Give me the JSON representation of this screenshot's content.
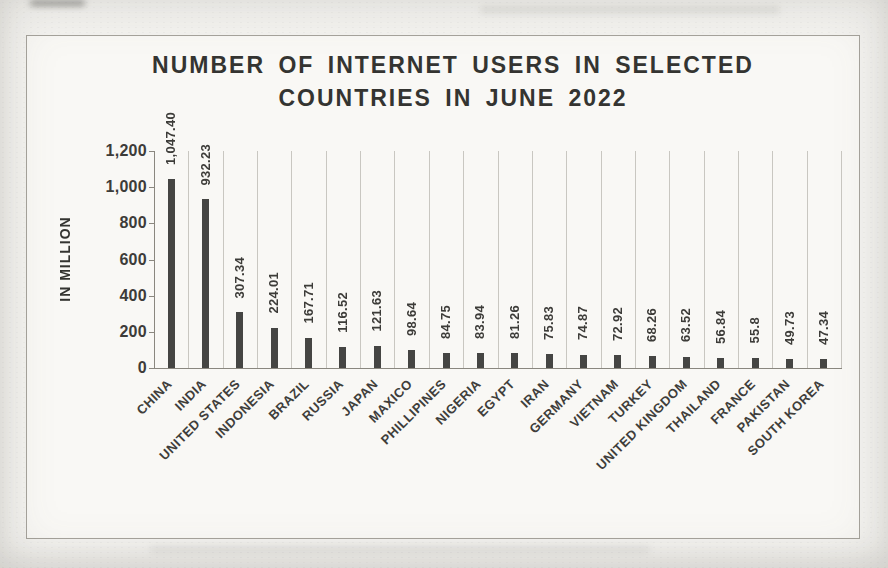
{
  "colors": {
    "bar": "#454543",
    "ink": "#343431",
    "gridline": "#c9c7c1",
    "axis": "#8a877f",
    "chart_border": "#a6a39c",
    "page_background": "#f4f3f0"
  },
  "chart_data": {
    "type": "bar",
    "title": "NUMBER OF INTERNET USERS IN SELECTED COUNTRIES IN JUNE 2022",
    "title_lines": [
      "NUMBER OF INTERNET USERS IN SELECTED",
      "COUNTRIES IN JUNE 2022"
    ],
    "xlabel": "",
    "ylabel": "IN MILLION",
    "ylim": [
      0,
      1200
    ],
    "ytick_step": 200,
    "ytick_labels": [
      "0",
      "200",
      "400",
      "600",
      "800",
      "1,000",
      "1,200"
    ],
    "grid": "vertical category gridlines only",
    "legend": "none",
    "data_labels": "rotated 90 degrees above each bar",
    "category_label_rotation_deg": 45,
    "categories": [
      "CHINA",
      "INDIA",
      "UNITED STATES",
      "INDONESIA",
      "BRAZIL",
      "RUSSIA",
      "JAPAN",
      "MAXICO",
      "PHILLIPINES",
      "NIGERIA",
      "EGYPT",
      "IRAN",
      "GERMANY",
      "VIETNAM",
      "TURKEY",
      "UNITED KINGDOM",
      "THAILAND",
      "FRANCE",
      "PAKISTAN",
      "SOUTH KOREA"
    ],
    "values": [
      1047.4,
      932.23,
      307.34,
      224.01,
      167.71,
      116.52,
      121.63,
      98.64,
      84.75,
      83.94,
      81.26,
      75.83,
      74.87,
      72.92,
      68.26,
      63.52,
      56.84,
      55.8,
      49.73,
      47.34
    ],
    "value_labels": [
      "1,047.40",
      "932.23",
      "307.34",
      "224.01",
      "167.71",
      "116.52",
      "121.63",
      "98.64",
      "84.75",
      "83.94",
      "81.26",
      "75.83",
      "74.87",
      "72.92",
      "68.26",
      "63.52",
      "56.84",
      "55.8",
      "49.73",
      "47.34"
    ]
  }
}
